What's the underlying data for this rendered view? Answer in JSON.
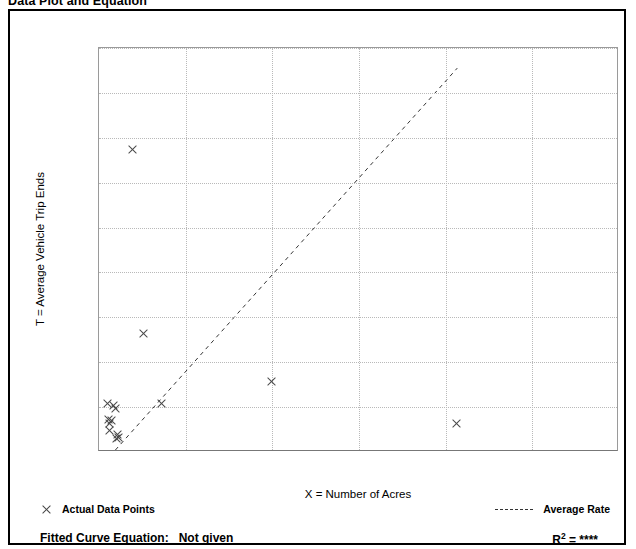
{
  "page": {
    "title": "Data Plot and Equation"
  },
  "chart_data": {
    "type": "scatter",
    "title": "Data Plot and Equation",
    "xlabel": "X = Number of Acres",
    "ylabel": "T = Average Vehicle Trip Ends",
    "xlim": [
      0,
      3000
    ],
    "ylim": [
      0,
      9000
    ],
    "grid": true,
    "x_ticks": [
      0,
      500,
      1000,
      1500,
      2000,
      2500,
      3000
    ],
    "x_tick_labels": [
      "0.00",
      "",
      "1000.00",
      "",
      "2000.00",
      "",
      "3000.00"
    ],
    "x_major_ticks": [
      0,
      1000,
      2000,
      3000
    ],
    "x_minor_ticks": [
      500,
      1500,
      2500
    ],
    "y_ticks": [
      0,
      1000,
      2000,
      3000,
      4000,
      5000,
      6000,
      7000,
      8000,
      9000
    ],
    "y_tick_labels": [
      "0",
      "1,000",
      "2,000",
      "3,000",
      "4,000",
      "5,000",
      "6,000",
      "7,000",
      "8,000",
      "9,000"
    ],
    "y_minor_ticks": [
      500,
      1500,
      2500,
      3500,
      4500,
      5500,
      6500,
      7500,
      8500
    ],
    "series": [
      {
        "name": "Actual Data Points",
        "marker": "x",
        "color": "#444444",
        "points": [
          {
            "x": 45,
            "y": 1090
          },
          {
            "x": 80,
            "y": 1035
          },
          {
            "x": 95,
            "y": 960
          },
          {
            "x": 50,
            "y": 720
          },
          {
            "x": 70,
            "y": 700
          },
          {
            "x": 60,
            "y": 640
          },
          {
            "x": 55,
            "y": 490
          },
          {
            "x": 105,
            "y": 395
          },
          {
            "x": 110,
            "y": 330
          },
          {
            "x": 100,
            "y": 300
          },
          {
            "x": 190,
            "y": 6730
          },
          {
            "x": 255,
            "y": 2650
          },
          {
            "x": 360,
            "y": 1070
          },
          {
            "x": 990,
            "y": 1570
          },
          {
            "x": 2060,
            "y": 630
          }
        ]
      },
      {
        "name": "Average Rate",
        "style": "dashed",
        "color": "#333333",
        "line": [
          {
            "x": 95,
            "y": 0
          },
          {
            "x": 2075,
            "y": 8550
          }
        ]
      }
    ],
    "legend": [
      {
        "label": "Actual Data Points",
        "marker": "x"
      },
      {
        "label": "Average Rate",
        "marker": "dashed-line"
      }
    ],
    "annotations": {
      "fitted_curve_label": "Fitted Curve Equation:",
      "fitted_curve_value": "Not given",
      "r_squared_label": "R",
      "r_squared_exponent": "2",
      "r_squared_equals": "=",
      "r_squared_value": "****"
    }
  }
}
